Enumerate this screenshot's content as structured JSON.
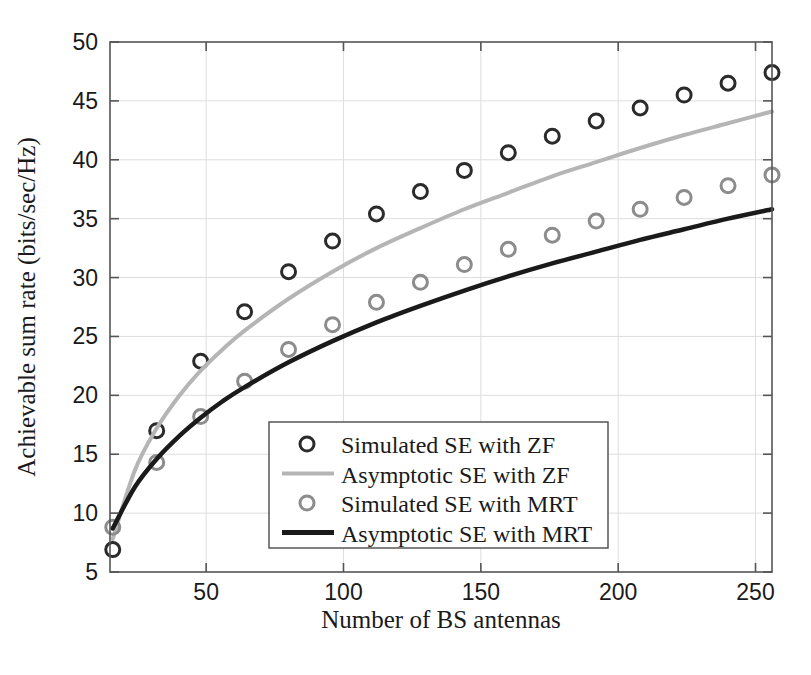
{
  "chart_data": {
    "type": "line",
    "title": "",
    "xlabel": "Number of BS antennas",
    "ylabel": "Achievable sum rate (bits/sec/Hz)",
    "xlim": [
      15,
      256
    ],
    "ylim": [
      5,
      50
    ],
    "xticks": [
      50,
      100,
      150,
      200,
      250
    ],
    "yticks": [
      5,
      10,
      15,
      20,
      25,
      30,
      35,
      40,
      45,
      50
    ],
    "grid": true,
    "legend_position": "lower-center-inside",
    "series": [
      {
        "name": "Simulated SE with ZF",
        "style": "markers",
        "marker": "circle-open",
        "color": "#2b2b2b",
        "x": [
          16,
          32,
          48,
          64,
          80,
          96,
          112,
          128,
          144,
          160,
          176,
          192,
          208,
          224,
          240,
          256
        ],
        "y": [
          6.9,
          17.0,
          22.9,
          27.1,
          30.5,
          33.1,
          35.4,
          37.3,
          39.1,
          40.6,
          42.0,
          43.3,
          44.4,
          45.5,
          46.5,
          47.4
        ]
      },
      {
        "name": "Asymptotic SE with ZF",
        "style": "line",
        "color": "#b5b5b5",
        "x": [
          16,
          24,
          32,
          40,
          48,
          56,
          64,
          80,
          96,
          112,
          128,
          144,
          160,
          176,
          192,
          208,
          224,
          240,
          256
        ],
        "y": [
          7.8,
          13.6,
          17.2,
          19.9,
          22.1,
          23.9,
          25.5,
          28.2,
          30.5,
          32.5,
          34.2,
          35.8,
          37.2,
          38.6,
          39.8,
          41.0,
          42.1,
          43.1,
          44.1
        ]
      },
      {
        "name": "Simulated SE with MRT",
        "style": "markers",
        "marker": "circle-open",
        "color": "#8c8c8c",
        "x": [
          16,
          32,
          48,
          64,
          80,
          96,
          112,
          128,
          144,
          160,
          176,
          192,
          208,
          224,
          240,
          256
        ],
        "y": [
          8.8,
          14.3,
          18.2,
          21.2,
          23.9,
          26.0,
          27.9,
          29.6,
          31.1,
          32.4,
          33.6,
          34.8,
          35.8,
          36.8,
          37.8,
          38.7
        ]
      },
      {
        "name": "Asymptotic SE with MRT",
        "style": "line",
        "color": "#1a1a1a",
        "x": [
          16,
          24,
          32,
          40,
          48,
          56,
          64,
          80,
          96,
          112,
          128,
          144,
          160,
          176,
          192,
          208,
          224,
          240,
          256
        ],
        "y": [
          8.7,
          12.2,
          14.6,
          16.5,
          18.1,
          19.5,
          20.7,
          22.8,
          24.6,
          26.2,
          27.6,
          28.9,
          30.1,
          31.2,
          32.2,
          33.2,
          34.1,
          35.0,
          35.8
        ]
      }
    ]
  },
  "axes": {
    "x_title": "Number of BS antennas",
    "y_title": "Achievable sum rate (bits/sec/Hz)",
    "x_tick_labels": [
      "50",
      "100",
      "150",
      "200",
      "250"
    ],
    "y_tick_labels": [
      "5",
      "10",
      "15",
      "20",
      "25",
      "30",
      "35",
      "40",
      "45",
      "50"
    ]
  },
  "legend": {
    "entries": [
      {
        "label": "Simulated SE with ZF",
        "kind": "marker",
        "color": "#2b2b2b"
      },
      {
        "label": "Asymptotic SE with ZF",
        "kind": "line",
        "color": "#b5b5b5"
      },
      {
        "label": "Simulated SE with MRT",
        "kind": "marker",
        "color": "#8c8c8c"
      },
      {
        "label": "Asymptotic SE with MRT",
        "kind": "line",
        "color": "#1a1a1a"
      }
    ]
  },
  "colors": {
    "axis": "#555555",
    "grid": "#dedede",
    "zf_asymptotic": "#b5b5b5",
    "mrt_asymptotic": "#1a1a1a",
    "zf_marker": "#2b2b2b",
    "mrt_marker": "#8c8c8c",
    "background": "#ffffff"
  }
}
